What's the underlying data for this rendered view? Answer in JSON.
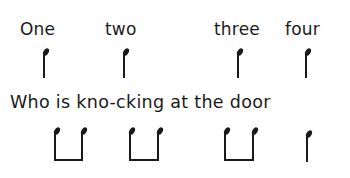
{
  "row1": {
    "words": [
      "One",
      "two",
      "three",
      "four"
    ],
    "rhythm": [
      "crotchet",
      "crotchet",
      "crotchet",
      "crotchet"
    ]
  },
  "row2": {
    "lyric": "Who is kno-cking at the door",
    "rhythm": [
      "quaver-pair",
      "quaver-pair",
      "quaver-pair",
      "crotchet"
    ]
  },
  "colors": {
    "ink": "#1a1a1a",
    "background": "#ffffff"
  }
}
